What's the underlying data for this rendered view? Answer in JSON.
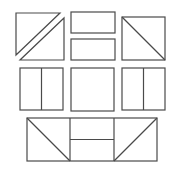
{
  "diagram": {
    "title": "",
    "stroke_color": "#4a4a4a",
    "background_color": "#ffffff",
    "pieces": [
      {
        "id": "top-left-upper-triangle",
        "kind": "triangle"
      },
      {
        "id": "top-left-lower-triangle",
        "kind": "triangle"
      },
      {
        "id": "top-middle-upper-rectangle",
        "kind": "rectangle"
      },
      {
        "id": "top-middle-lower-rectangle",
        "kind": "rectangle"
      },
      {
        "id": "top-right-square-with-diagonal",
        "kind": "square-diagonal"
      },
      {
        "id": "middle-left-square-split-vertical",
        "kind": "square-vertical-split"
      },
      {
        "id": "middle-center-square",
        "kind": "square"
      },
      {
        "id": "middle-right-square-split-vertical",
        "kind": "square-vertical-split"
      },
      {
        "id": "bottom-composite-rectangle",
        "kind": "composite"
      }
    ]
  }
}
